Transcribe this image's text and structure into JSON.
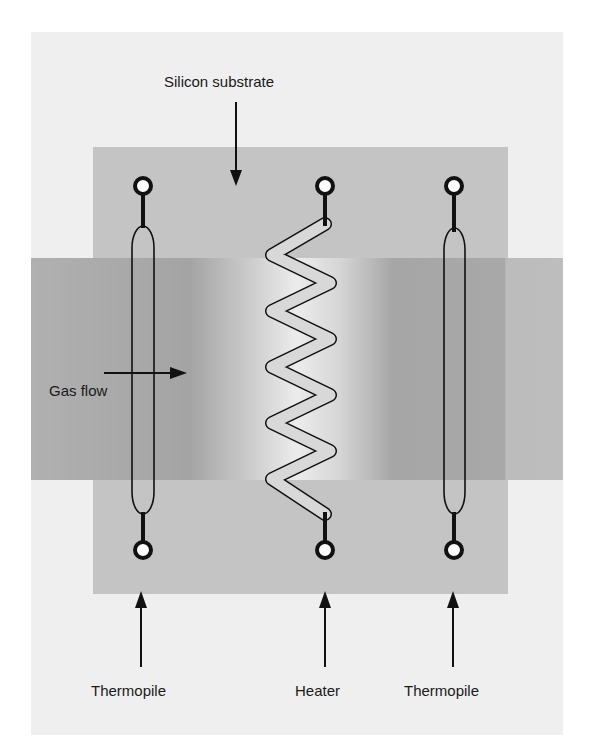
{
  "figure": {
    "labels": {
      "substrate": "Silicon substrate",
      "gas_flow": "Gas flow",
      "left_thermopile": "Thermopile",
      "heater": "Heater",
      "right_thermopile": "Thermopile"
    },
    "components": [
      {
        "id": "left-thermopile",
        "type": "thermopile",
        "x": 143
      },
      {
        "id": "heater",
        "type": "heater",
        "x": 325
      },
      {
        "id": "right-thermopile",
        "type": "thermopile",
        "x": 454
      }
    ],
    "colors": {
      "background": "#ffffff",
      "outer_panel": "#efefef",
      "substrate": "#c4c4c4",
      "gas_band": "#a8a8a8",
      "heated_zone": "#f0f0f0",
      "lines": "#111111"
    }
  }
}
